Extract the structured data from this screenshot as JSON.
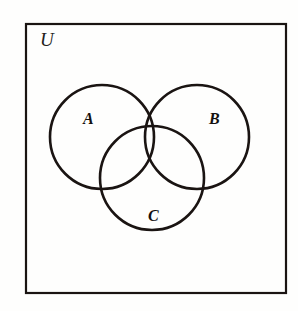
{
  "figure": {
    "type": "venn-diagram",
    "title": "",
    "background_color": "#fefefd",
    "stroke_color": "#1a1412",
    "universe": {
      "label": "U",
      "shape": "rectangle",
      "x": 26,
      "y": 24,
      "width": 260,
      "height": 269,
      "stroke_width": 2.2
    },
    "sets": [
      {
        "id": "A",
        "label": "A",
        "cx": 102,
        "cy": 137,
        "r": 52,
        "stroke_width": 2.6,
        "label_x": 90,
        "label_y": 122
      },
      {
        "id": "B",
        "label": "B",
        "cx": 197,
        "cy": 137,
        "r": 52,
        "stroke_width": 2.6,
        "label_x": 216,
        "label_y": 122
      },
      {
        "id": "C",
        "label": "C",
        "cx": 152,
        "cy": 178,
        "r": 52,
        "stroke_width": 2.6,
        "label_x": 155,
        "label_y": 219
      }
    ]
  },
  "chart_data": {
    "type": "diagram",
    "subtype": "venn",
    "universe_label": "U",
    "set_labels": [
      "A",
      "B",
      "C"
    ],
    "regions": [
      "A only",
      "B only",
      "C only",
      "A ∩ B",
      "A ∩ C",
      "B ∩ C",
      "A ∩ B ∩ C",
      "outside all sets (within U)"
    ],
    "values": [],
    "legend": [],
    "grid": false
  }
}
